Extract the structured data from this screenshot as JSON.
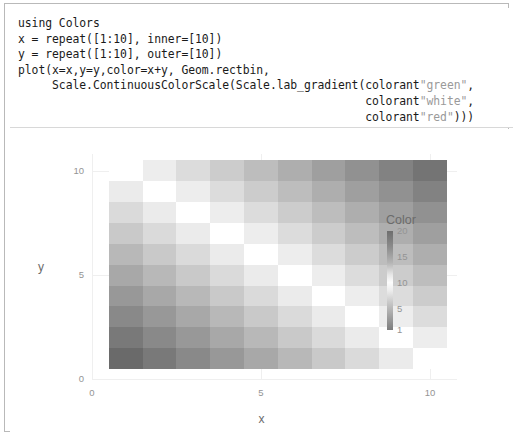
{
  "code": {
    "language": "julia",
    "lines": [
      [
        {
          "t": "plain",
          "s": "using Colors"
        }
      ],
      [
        {
          "t": "plain",
          "s": "x = repeat([1:10], inner=[10])"
        }
      ],
      [
        {
          "t": "plain",
          "s": "y = repeat([1:10], outer=[10])"
        }
      ],
      [
        {
          "t": "plain",
          "s": "plot(x=x,y=y,color=x+y, Geom.rectbin,"
        }
      ],
      [
        {
          "t": "plain",
          "s": "     Scale.ContinuousColorScale(Scale.lab_gradient(colorant"
        },
        {
          "t": "str",
          "s": "\"green\""
        },
        {
          "t": "plain",
          "s": ","
        }
      ],
      [
        {
          "t": "plain",
          "s": "                                                   colorant"
        },
        {
          "t": "str",
          "s": "\"white\""
        },
        {
          "t": "plain",
          "s": ","
        }
      ],
      [
        {
          "t": "plain",
          "s": "                                                   colorant"
        },
        {
          "t": "str",
          "s": "\"red\""
        },
        {
          "t": "plain",
          "s": ")))"
        }
      ]
    ]
  },
  "plot": {
    "xlabel": "x",
    "ylabel": "y",
    "x_ticks": [
      "0",
      "5",
      "10"
    ],
    "y_ticks": [
      "0",
      "5",
      "10"
    ],
    "legend": {
      "title": "Color",
      "ticks": [
        "20",
        "15",
        "10",
        "5",
        "1"
      ]
    }
  },
  "chart_data": {
    "type": "heatmap",
    "title": "",
    "xlabel": "x",
    "ylabel": "y",
    "xlim": [
      0,
      10.8
    ],
    "ylim": [
      0,
      10.8
    ],
    "x_ticks": [
      0,
      5,
      10
    ],
    "y_ticks": [
      0,
      5,
      10
    ],
    "grid": true,
    "legend_position": "right",
    "legend_title": "Color",
    "legend_ticks": [
      20,
      15,
      10,
      5,
      1
    ],
    "colorscale": {
      "type": "lab_gradient",
      "stops": [
        "green",
        "white",
        "red"
      ],
      "rendered_as": "grayscale",
      "vmin": 2,
      "vmax": 20,
      "vmid": 11
    },
    "x": [
      1,
      2,
      3,
      4,
      5,
      6,
      7,
      8,
      9,
      10
    ],
    "y": [
      1,
      2,
      3,
      4,
      5,
      6,
      7,
      8,
      9,
      10
    ],
    "value_formula": "color = x + y",
    "values": [
      [
        2,
        3,
        4,
        5,
        6,
        7,
        8,
        9,
        10,
        11
      ],
      [
        3,
        4,
        5,
        6,
        7,
        8,
        9,
        10,
        11,
        12
      ],
      [
        4,
        5,
        6,
        7,
        8,
        9,
        10,
        11,
        12,
        13
      ],
      [
        5,
        6,
        7,
        8,
        9,
        10,
        11,
        12,
        13,
        14
      ],
      [
        6,
        7,
        8,
        9,
        10,
        11,
        12,
        13,
        14,
        15
      ],
      [
        7,
        8,
        9,
        10,
        11,
        12,
        13,
        14,
        15,
        16
      ],
      [
        8,
        9,
        10,
        11,
        12,
        13,
        14,
        15,
        16,
        17
      ],
      [
        9,
        10,
        11,
        12,
        13,
        14,
        15,
        16,
        17,
        18
      ],
      [
        10,
        11,
        12,
        13,
        14,
        15,
        16,
        17,
        18,
        19
      ],
      [
        11,
        12,
        13,
        14,
        15,
        16,
        17,
        18,
        19,
        20
      ]
    ]
  }
}
